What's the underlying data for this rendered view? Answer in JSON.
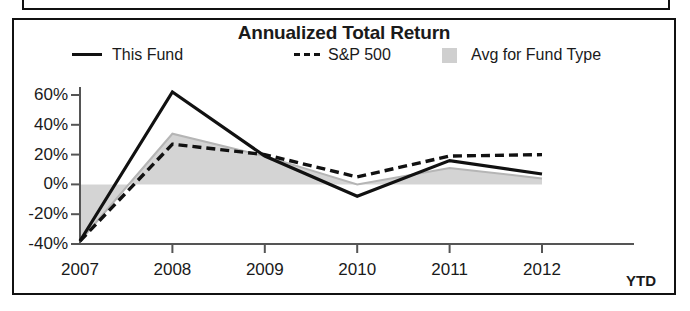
{
  "chart_data": {
    "type": "line",
    "title": "Annualized Total Return",
    "xlabel": "",
    "ylabel": "",
    "categories": [
      "2007",
      "2008",
      "2009",
      "2010",
      "2011",
      "2012"
    ],
    "x_axis_suffix": "YTD",
    "ylim": [
      -40,
      70
    ],
    "ytick_labels": [
      "60%",
      "40%",
      "20%",
      "0%",
      "-20%",
      "-40%"
    ],
    "ytick_values": [
      60,
      40,
      20,
      0,
      -20,
      -40
    ],
    "grid": false,
    "legend_position": "top",
    "series": [
      {
        "name": "This Fund",
        "style": "solid",
        "color": "#111111",
        "values": [
          -38,
          62,
          19,
          -8,
          16,
          7
        ]
      },
      {
        "name": "S&P 500",
        "style": "dashed",
        "color": "#111111",
        "values": [
          -38,
          27,
          20,
          5,
          19,
          20
        ]
      },
      {
        "name": "Avg for Fund Type",
        "style": "area",
        "color": "#cfcfcf",
        "values": [
          -38,
          34,
          19,
          0,
          11,
          4
        ]
      }
    ]
  },
  "chart": {
    "title": "Annualized Total Return",
    "legend": [
      {
        "label": "This Fund",
        "marker": "solid-line-swatch"
      },
      {
        "label": "S&P 500",
        "marker": "dashed-line-swatch"
      },
      {
        "label": "Avg for Fund Type",
        "marker": "gray-area-swatch"
      }
    ],
    "y_ticks": [
      "60%",
      "40%",
      "20%",
      "0%",
      "-20%",
      "-40%"
    ],
    "x_ticks": [
      "2007",
      "2008",
      "2009",
      "2010",
      "2011",
      "2012"
    ],
    "x_axis_note": "YTD",
    "colors": {
      "line": "#111111",
      "area_fill": "#cfcfcf",
      "axis": "#555555",
      "border": "#111111"
    }
  }
}
